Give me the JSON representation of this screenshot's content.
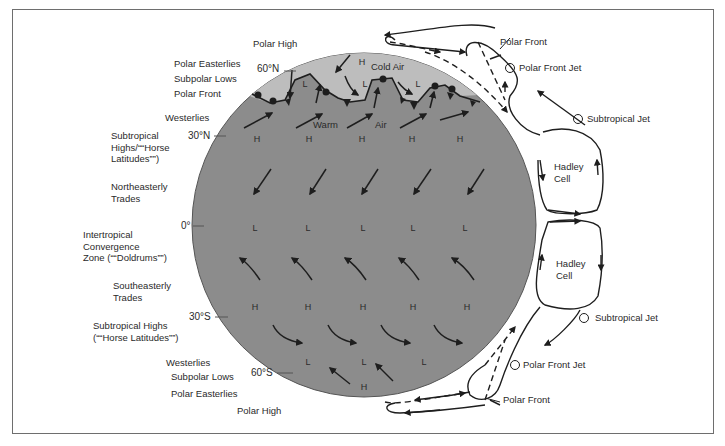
{
  "diagram": {
    "colors": {
      "globe": "#8c8c8c",
      "polar_cap": "#bdbdbd",
      "line": "#1e1e1e",
      "frame": "#6e6e6e",
      "background": "#ffffff"
    },
    "left_labels": {
      "polar_high_n": "Polar High",
      "polar_easterlies_n": "Polar Easterlies",
      "subpolar_lows_n": "Subpolar Lows",
      "polar_front_n": "Polar Front",
      "westerlies_n": "Westerlies",
      "subtropical_highs_n": "Subtropical\nHighs/““Horse\nLatitudes””)",
      "ne_trades": "Northeasterly\nTrades",
      "itcz": "Intertropical\nConvergence\nZone (““Doldrums””)",
      "se_trades": "Southeasterly\nTrades",
      "subtropical_highs_s": "Subtropical Highs\n(““Horse Latitudes””)",
      "westerlies_s": "Westerlies",
      "subpolar_lows_s": "Subpolar Lows",
      "polar_easterlies_s": "Polar Easterlies",
      "polar_high_s": "Polar High"
    },
    "latitudes": {
      "n60": "60°N",
      "n30": "30°N",
      "eq": "0°",
      "s30": "30°S",
      "s60": "60°S"
    },
    "globe_labels": {
      "cold_air": "Cold Air",
      "warm": "Warm",
      "air": "Air",
      "polar_h": "H",
      "polar_lows": [
        "L",
        "L",
        "L"
      ],
      "n30_highs": [
        "H",
        "H",
        "H",
        "H",
        "H"
      ],
      "eq_lows": [
        "L",
        "L",
        "L",
        "L",
        "L"
      ],
      "s30_highs": [
        "H",
        "H",
        "H",
        "H",
        "H"
      ],
      "s60_lows": [
        "L",
        "L",
        "L"
      ],
      "s_polar_h": "H"
    },
    "right_labels": {
      "polar_front_n": "Polar Front",
      "polar_front_jet_n": "Polar Front Jet",
      "subtropical_jet_n": "Subtropical Jet",
      "hadley_cell_n": "Hadley\nCell",
      "hadley_cell_s": "Hadley\nCell",
      "subtropical_jet_s": "Subtropical Jet",
      "polar_front_jet_s": "Polar Front Jet",
      "polar_front_s": "Polar Front"
    }
  }
}
